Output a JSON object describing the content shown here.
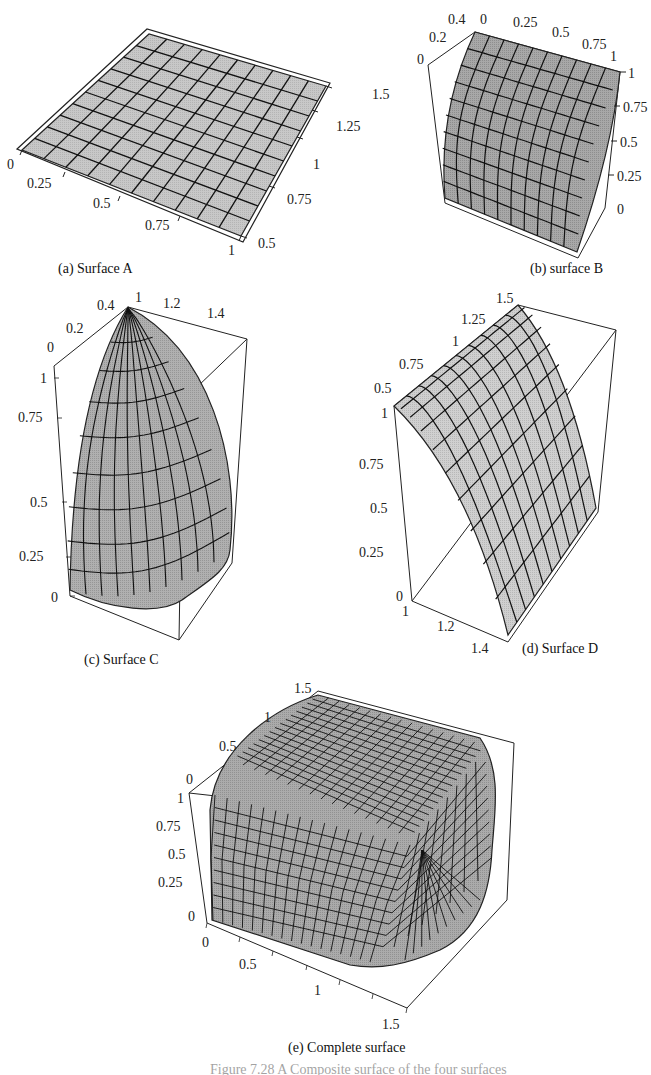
{
  "figure": {
    "panels": [
      {
        "id": "a",
        "caption": "(a) Surface A",
        "ticks_x": [
          "0",
          "0.25",
          "0.5",
          "0.75",
          "1"
        ],
        "ticks_y": [
          "0.5",
          "0.75",
          "1",
          "1.25",
          "1.5"
        ]
      },
      {
        "id": "b",
        "caption": "(b) surface B",
        "ticks_depth": [
          "0",
          "0.2",
          "0.4"
        ],
        "ticks_x": [
          "0",
          "0.25",
          "0.5",
          "0.75",
          "1"
        ],
        "ticks_z": [
          "1",
          "0.75",
          "0.5",
          "0.25",
          "0"
        ]
      },
      {
        "id": "c",
        "caption": "(c) Surface C",
        "ticks_depth": [
          "0",
          "0.2",
          "0.4"
        ],
        "ticks_x": [
          "1",
          "1.2",
          "1.4"
        ],
        "ticks_z": [
          "1",
          "0.75",
          "0.5",
          "0.25",
          "0"
        ]
      },
      {
        "id": "d",
        "caption": "(d) Surface D",
        "ticks_depth": [
          "0.5",
          "0.75",
          "1",
          "1.25",
          "1.5"
        ],
        "ticks_z": [
          "1",
          "0.75",
          "0.5",
          "0.25",
          "0"
        ],
        "ticks_x": [
          "1",
          "1.2",
          "1.4"
        ]
      },
      {
        "id": "e",
        "caption": "(e) Complete surface",
        "ticks_depth": [
          "0",
          "0.5",
          "1",
          "1.5"
        ],
        "ticks_z": [
          "1",
          "0.75",
          "0.5",
          "0.25",
          "0"
        ],
        "ticks_x": [
          "0",
          "0.5",
          "1",
          "1.5"
        ]
      }
    ],
    "figure_caption_partial": "Figure 7.28   A Composite surface of the four surfaces"
  },
  "chart_data": [
    {
      "type": "surface3d",
      "title": "(a) Surface A",
      "description": "Flat planar patch (z constant) shown in perspective",
      "x_range": [
        0,
        1
      ],
      "y_range": [
        0.5,
        1.5
      ],
      "x_ticks": [
        0,
        0.25,
        0.5,
        0.75,
        1
      ],
      "y_ticks": [
        0.5,
        0.75,
        1,
        1.25,
        1.5
      ],
      "grid": "10x10"
    },
    {
      "type": "surface3d",
      "title": "(b) surface B",
      "description": "Cylindrical quarter surface rising from z=0 to z=1 over depth 0-0.5",
      "x_range": [
        0,
        1
      ],
      "depth_range": [
        0,
        0.5
      ],
      "z_range": [
        0,
        1
      ],
      "x_ticks": [
        0,
        0.25,
        0.5,
        0.75,
        1
      ],
      "depth_ticks": [
        0,
        0.2,
        0.4
      ],
      "z_ticks": [
        0,
        0.25,
        0.5,
        0.75,
        1
      ],
      "grid": "10x10"
    },
    {
      "type": "surface3d",
      "title": "(c) Surface C",
      "description": "Spherical corner patch (octant) with apex at top",
      "x_range": [
        1,
        1.5
      ],
      "depth_range": [
        0,
        0.5
      ],
      "z_range": [
        0,
        1
      ],
      "x_ticks": [
        1,
        1.2,
        1.4
      ],
      "depth_ticks": [
        0,
        0.2,
        0.4
      ],
      "z_ticks": [
        0,
        0.25,
        0.5,
        0.75,
        1
      ],
      "grid": "radial 10x8"
    },
    {
      "type": "surface3d",
      "title": "(d) Surface D",
      "description": "Cylindrical quarter surface falling from z=1 to z=0 over x 1-1.5",
      "x_range": [
        1,
        1.5
      ],
      "depth_range": [
        0.5,
        1.5
      ],
      "z_range": [
        0,
        1
      ],
      "x_ticks": [
        1,
        1.2,
        1.4
      ],
      "depth_ticks": [
        0.5,
        0.75,
        1,
        1.25,
        1.5
      ],
      "z_ticks": [
        0,
        0.25,
        0.5,
        0.75,
        1
      ],
      "grid": "10x10"
    },
    {
      "type": "surface3d",
      "title": "(e) Complete surface",
      "description": "Composite rounded-box surface combining A, B, C, D and their reflections",
      "x_range": [
        0,
        1.5
      ],
      "depth_range": [
        0,
        1.5
      ],
      "z_range": [
        0,
        1
      ],
      "x_ticks": [
        0,
        0.5,
        1,
        1.5
      ],
      "depth_ticks": [
        0,
        0.5,
        1,
        1.5
      ],
      "z_ticks": [
        0,
        0.25,
        0.5,
        0.75,
        1
      ],
      "grid": "fine"
    }
  ]
}
